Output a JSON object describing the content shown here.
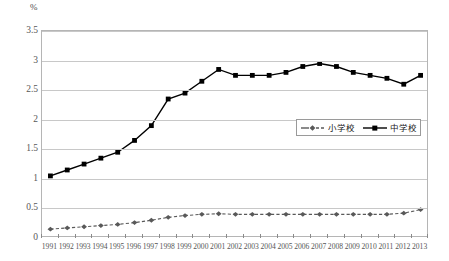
{
  "unit_label": "%",
  "y_axis": {
    "ticks": [
      "0",
      "0.5",
      "1",
      "1.5",
      "2",
      "2.5",
      "3",
      "3.5"
    ],
    "min": 0,
    "max": 3.5
  },
  "legend": {
    "entries": [
      {
        "label": "小学校",
        "marker": "diamond-marker",
        "style": "dashed",
        "color": "#595959"
      },
      {
        "label": "中学校",
        "marker": "square-marker",
        "style": "solid",
        "color": "#000000"
      }
    ]
  },
  "chart_data": {
    "type": "line",
    "title": "",
    "xlabel": "",
    "ylabel": "%",
    "ylim": [
      0,
      3.5
    ],
    "yticks": [
      0,
      0.5,
      1,
      1.5,
      2,
      2.5,
      3,
      3.5
    ],
    "grid": true,
    "legend_position": "inside-right",
    "categories": [
      "1991",
      "1992",
      "1993",
      "1994",
      "1995",
      "1996",
      "1997",
      "1998",
      "1999",
      "2000",
      "2001",
      "2002",
      "2003",
      "2004",
      "2005",
      "2006",
      "2007",
      "2008",
      "2009",
      "2010",
      "2011",
      "2012",
      "2013"
    ],
    "series": [
      {
        "name": "小学校",
        "color": "#595959",
        "line_style": "dashed",
        "marker": "diamond",
        "values": [
          0.15,
          0.17,
          0.19,
          0.21,
          0.23,
          0.26,
          0.3,
          0.35,
          0.38,
          0.4,
          0.41,
          0.4,
          0.4,
          0.4,
          0.4,
          0.4,
          0.4,
          0.4,
          0.4,
          0.4,
          0.4,
          0.42,
          0.48
        ]
      },
      {
        "name": "中学校",
        "color": "#000000",
        "line_style": "solid",
        "marker": "square",
        "values": [
          1.05,
          1.15,
          1.25,
          1.35,
          1.45,
          1.65,
          1.9,
          2.35,
          2.45,
          2.65,
          2.85,
          2.75,
          2.75,
          2.75,
          2.8,
          2.9,
          2.95,
          2.9,
          2.8,
          2.75,
          2.7,
          2.6,
          2.75
        ]
      }
    ]
  }
}
